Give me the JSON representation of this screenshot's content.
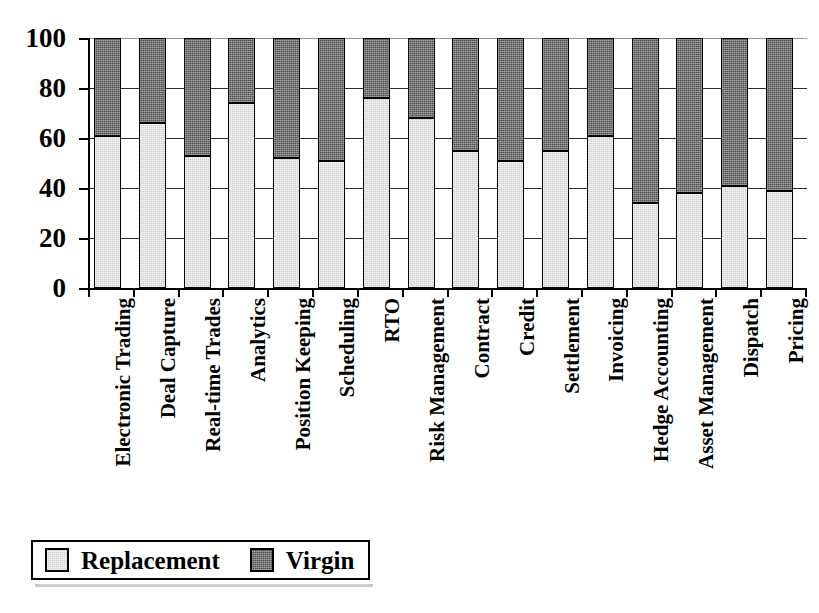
{
  "chart_data": {
    "type": "bar",
    "subtype": "stacked-percentage-column",
    "title": "",
    "subtitle": "",
    "xlabel": "",
    "ylabel": "",
    "ylim": [
      0,
      100
    ],
    "yticks": [
      0,
      20,
      40,
      60,
      80,
      100
    ],
    "ytick_labels": [
      "0",
      "20",
      "40",
      "60",
      "80",
      "100"
    ],
    "grid": true,
    "legend_position": "bottom-left",
    "categories": [
      "Electronic Trading",
      "Deal Capture",
      "Real-time Trades",
      "Analytics",
      "Position Keeping",
      "Scheduling",
      "RTO",
      "Risk Management",
      "Contract",
      "Credit",
      "Settlement",
      "Invoicing",
      "Hedge Accounting",
      "Asset Management",
      "Dispatch",
      "Pricing"
    ],
    "series": [
      {
        "name": "Replacement",
        "color": "#cfcfcf",
        "values": [
          61,
          66,
          53,
          74,
          52,
          51,
          76,
          68,
          55,
          51,
          55,
          61,
          34,
          38,
          41,
          39
        ]
      },
      {
        "name": "Virgin",
        "color": "#4f4f4f",
        "values": [
          39,
          34,
          47,
          26,
          48,
          49,
          24,
          32,
          45,
          49,
          45,
          39,
          66,
          62,
          59,
          61
        ]
      }
    ]
  },
  "legend": {
    "items": [
      {
        "label": "Replacement",
        "swatch": "light-gray-swatch"
      },
      {
        "label": "Virgin",
        "swatch": "dark-gray-swatch"
      }
    ]
  },
  "axis": {
    "y_tick_labels": [
      "100",
      "80",
      "60",
      "40",
      "20",
      "0"
    ],
    "y_tick_values": [
      100,
      80,
      60,
      40,
      20,
      0
    ]
  }
}
